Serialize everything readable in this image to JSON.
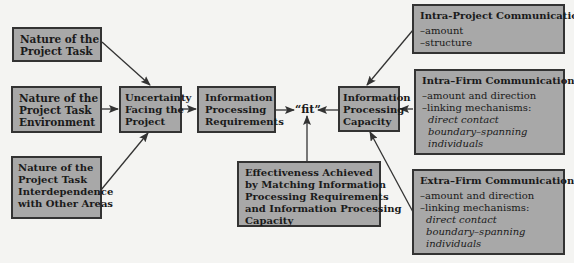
{
  "diagram": {
    "inputs": [
      {
        "id": "task",
        "lines": [
          "Nature of the",
          "Project Task"
        ]
      },
      {
        "id": "environment",
        "lines": [
          "Nature of the",
          "Project Task",
          "Environment"
        ]
      },
      {
        "id": "interdependence",
        "lines": [
          "Nature of the",
          "Project Task",
          "Interdependence",
          "with Other Areas"
        ]
      }
    ],
    "uncertainty": {
      "lines": [
        "Uncertainty",
        "Facing the",
        "Project"
      ]
    },
    "requirements": {
      "lines": [
        "Information",
        "Processing",
        "Requirements"
      ]
    },
    "fit": {
      "label": "“fit”"
    },
    "capacity": {
      "lines": [
        "Information",
        "Processing",
        "Capacity"
      ]
    },
    "effectiveness": {
      "lines": [
        "Effectiveness Achieved",
        "by Matching Information",
        "Processing Requirements",
        "and Information Processing",
        "Capacity"
      ]
    },
    "communication": [
      {
        "id": "intra_project",
        "title": "Intra-Project Communication",
        "items": [
          "–amount",
          "–structure"
        ],
        "italic": []
      },
      {
        "id": "intra_firm",
        "title": "Intra–Firm Communication",
        "items": [
          "–amount and direction",
          "–linking mechanisms:"
        ],
        "italic": [
          "direct contact",
          "boundary–spanning",
          "individuals"
        ]
      },
      {
        "id": "extra_firm",
        "title": "Extra–Firm Communication",
        "items": [
          "–amount and direction",
          "–linking mechanisms:"
        ],
        "italic": [
          "direct contact",
          "boundary–spanning",
          "individuals"
        ]
      }
    ],
    "colors": {
      "box_fill": "#a8a8a8",
      "border": "#333333",
      "background": "#f4f4f2",
      "arrow": "#333333"
    }
  }
}
